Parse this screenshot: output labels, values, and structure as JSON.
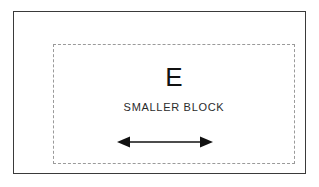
{
  "diagram": {
    "background_color": "#ffffff",
    "outer_block": {
      "name": "larger-block-outline",
      "border_style": "solid",
      "border_color": "#3a3a3a",
      "border_width_px": 1.5
    },
    "inner_block": {
      "name": "smaller-block-outline",
      "border_style": "dashed",
      "border_color": "#9a9a9a",
      "border_width_px": 1
    },
    "labels": {
      "letter": "E",
      "caption": "SMALLER BLOCK"
    },
    "arrow": {
      "name": "double-headed-arrow",
      "direction": "horizontal-both",
      "color": "#111111",
      "shaft_width_px": 1.5,
      "length_px": 92
    }
  }
}
